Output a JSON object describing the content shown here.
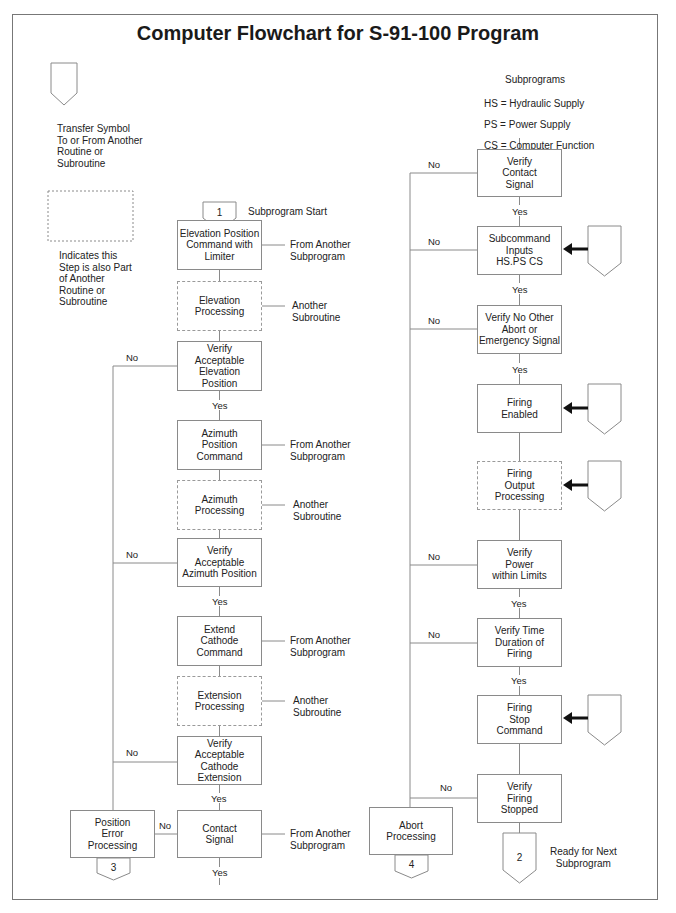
{
  "title": "Computer Flowchart for S-91-100 Program",
  "colors": {
    "line": "#8a8a8a",
    "arrow": "#111111",
    "border": "#777777",
    "text": "#222222"
  },
  "legend": {
    "transfer_symbol": "Transfer Symbol\nTo or From Another\nRoutine or\nSubroutine",
    "dashed_box": "Indicates this\nStep is also Part\nof Another\nRoutine or\nSubroutine"
  },
  "subprograms": {
    "heading": "Subprograms",
    "items": [
      "HS = Hydraulic Supply",
      "PS = Power Supply",
      "CS = Computer Function"
    ]
  },
  "left_column": {
    "start_connector": "1",
    "start_label": "Subprogram Start",
    "steps": [
      {
        "text": "Elevation Position\nCommand with\nLimiter",
        "side_note": "From Another\nSubprogram"
      },
      {
        "text": "Elevation\nProcessing",
        "side_note": "Another\nSubroutine",
        "dashed": true
      },
      {
        "text": "Verify\nAcceptable\nElevation\nPosition",
        "no_label": "No",
        "yes_label": "Yes"
      },
      {
        "text": "Azimuth\nPosition\nCommand",
        "side_note": "From Another\nSubprogram"
      },
      {
        "text": "Azimuth\nProcessing",
        "side_note": "Another\nSubroutine",
        "dashed": true
      },
      {
        "text": "Verify\nAcceptable\nAzimuth Position",
        "no_label": "No",
        "yes_label": "Yes"
      },
      {
        "text": "Extend\nCathode\nCommand",
        "side_note": "From Another\nSubprogram"
      },
      {
        "text": "Extension\nProcessing",
        "side_note": "Another\nSubroutine",
        "dashed": true
      },
      {
        "text": "Verify\nAcceptable\nCathode\nExtension",
        "no_label": "No",
        "yes_label": "Yes"
      },
      {
        "text": "Contact\nSignal",
        "side_note": "From Another\nSubprogram",
        "no_label": "No",
        "yes_label": "Yes"
      }
    ],
    "error_box": {
      "text": "Position\nError\nProcessing",
      "connector": "3"
    }
  },
  "right_column": {
    "steps": [
      {
        "text": "Verify\nContact\nSignal",
        "no_label": "No",
        "yes_label": "Yes"
      },
      {
        "text": "Subcommand\nInputs\nHS.PS CS",
        "no_label": "No",
        "yes_label": "Yes",
        "transfer_in": true
      },
      {
        "text": "Verify No Other\nAbort or\nEmergency Signal",
        "no_label": "No",
        "yes_label": "Yes"
      },
      {
        "text": "Firing\nEnabled",
        "transfer_in": true
      },
      {
        "text": "Firing\nOutput\nProcessing",
        "dashed": true,
        "transfer_in": true
      },
      {
        "text": "Verify\nPower\nwithin Limits",
        "no_label": "No",
        "yes_label": "Yes"
      },
      {
        "text": "Verify Time\nDuration of\nFiring",
        "no_label": "No",
        "yes_label": "Yes"
      },
      {
        "text": "Firing\nStop\nCommand",
        "transfer_in": true
      },
      {
        "text": "Verify\nFiring\nStopped",
        "no_label": "No"
      }
    ],
    "abort_box": {
      "text": "Abort\nProcessing",
      "connector": "4"
    },
    "end_connector": "2",
    "end_label": "Ready for Next\nSubprogram"
  }
}
